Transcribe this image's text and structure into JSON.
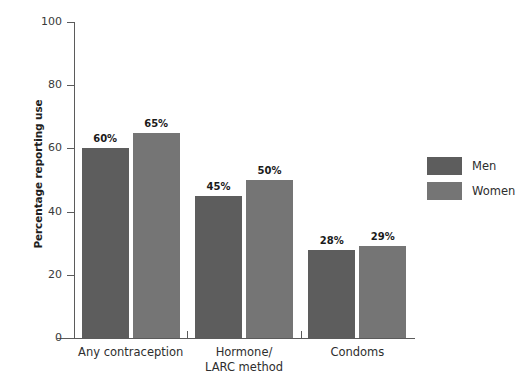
{
  "chart_data": {
    "type": "bar",
    "title": "",
    "xlabel": "",
    "ylabel": "Percentage reporting use",
    "ylim": [
      0,
      100
    ],
    "yticks": [
      0,
      20,
      40,
      60,
      80,
      100
    ],
    "ytick_labels": [
      "0",
      "20",
      "40",
      "60",
      "80",
      "100"
    ],
    "grid": false,
    "legend_position": "right",
    "categories": [
      "Any contraception",
      "Hormone/\nLARC method",
      "Condoms"
    ],
    "series": [
      {
        "name": "Men",
        "color": "#5d5d5d",
        "values": [
          60,
          45,
          28
        ],
        "value_labels": [
          "60%",
          "45%",
          "28%"
        ]
      },
      {
        "name": "Women",
        "color": "#757575",
        "values": [
          65,
          50,
          29
        ],
        "value_labels": [
          "65%",
          "50%",
          "29%"
        ]
      }
    ]
  },
  "legend": {
    "items": [
      {
        "label": "Men",
        "color": "#5d5d5d"
      },
      {
        "label": "Women",
        "color": "#757575"
      }
    ]
  },
  "axes": {
    "y_title": "Percentage reporting use"
  }
}
